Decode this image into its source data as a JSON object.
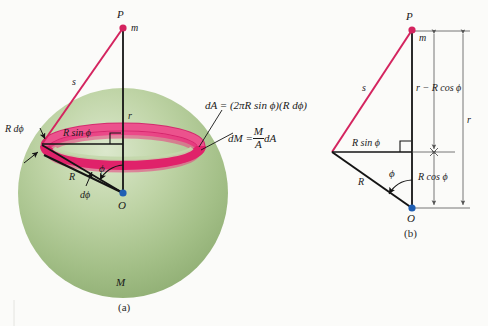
{
  "figure": {
    "panel_a": {
      "caption": "(a)",
      "point_P": "P",
      "mass_m": "m",
      "distance_s": "s",
      "distance_r": "r",
      "radius_R": "R",
      "ring_radius": "R sin ϕ",
      "ring_width": "R dϕ",
      "angle_phi": "ϕ",
      "angle_dphi": "dϕ",
      "center_O": "O",
      "sphere_mass": "M",
      "eq_dA": "dA = (2πR sin ϕ)(R  dϕ)",
      "eq_dM_lhs": "dM =",
      "eq_dM_num": "M",
      "eq_dM_den": "A",
      "eq_dM_rhs": "dA"
    },
    "panel_b": {
      "caption": "(b)",
      "point_P": "P",
      "mass_m": "m",
      "distance_s": "s",
      "distance_r": "r",
      "radius_R": "R",
      "horizontal_leg": "R sin ϕ",
      "vertical_upper": "r − R cos ϕ",
      "vertical_lower": "R cos ϕ",
      "angle_phi": "ϕ",
      "center_O": "O"
    },
    "colors": {
      "sphere_light": "#d5e3c4",
      "sphere_mid": "#a8c48c",
      "sphere_dark": "#7f9f63",
      "ring": "#e0226a",
      "ring_dark": "#c4155a",
      "line_s": "#d4245f",
      "line_black": "#141414",
      "dot_P": "#d4245f",
      "dot_O": "#1f5fb4",
      "dimension": "#555555",
      "background": "#fbfbf9"
    }
  }
}
